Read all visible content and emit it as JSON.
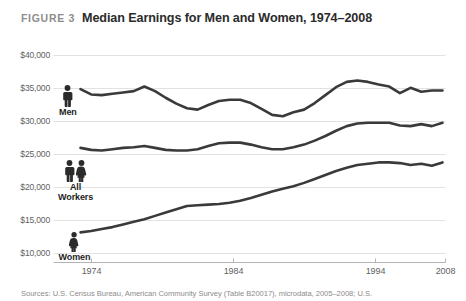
{
  "figure": {
    "label": "FIGURE 3",
    "title": "Median Earnings for Men and Women, 1974–2008",
    "source": "Sources: U.S. Census Bureau, American Community Survey (Table B20017), microdata, 2005–2008; U.S."
  },
  "colors": {
    "line": "#3a3a3a",
    "gridline": "#e2e2e2",
    "axis": "#b4b4b4",
    "label_text": "#5f5f5f",
    "title_text": "#2b2b2b",
    "figure_label_text": "#8d8d8d",
    "icon": "#2b2b2b",
    "background": "#ffffff"
  },
  "annotations": [
    {
      "name": "Men",
      "icon": "male-figure-icon",
      "icon_count": 1
    },
    {
      "name": "All\nWorkers",
      "icon": "male-female-figure-icon",
      "icon_count": 2
    },
    {
      "name": "Women",
      "icon": "female-figure-icon",
      "icon_count": 1
    }
  ],
  "chart_data": {
    "type": "line",
    "title": "Median Earnings for Men and Women, 1974–2008",
    "xlabel": "",
    "ylabel": "",
    "grid": true,
    "legend": "inline-labels",
    "xlim": [
      1974,
      2008
    ],
    "ylim": [
      10000,
      40000
    ],
    "ytick_labels": [
      "$40,000",
      "$35,000",
      "$30,000",
      "$25,000",
      "$20,000",
      "$15,000",
      "$10,000"
    ],
    "yticks": [
      40000,
      35000,
      30000,
      25000,
      20000,
      15000,
      10000
    ],
    "xtick_labels": [
      "1974",
      "1984",
      "1994",
      "2008"
    ],
    "xticks": [
      1974,
      1984,
      1994,
      2008
    ],
    "x": [
      1974,
      1975,
      1976,
      1977,
      1978,
      1979,
      1980,
      1981,
      1982,
      1983,
      1984,
      1985,
      1986,
      1987,
      1988,
      1989,
      1990,
      1991,
      1992,
      1993,
      1994,
      1995,
      1996,
      1997,
      1998,
      1999,
      2000,
      2001,
      2002,
      2003,
      2004,
      2005,
      2006,
      2007,
      2008
    ],
    "series": [
      {
        "name": "Men",
        "values": [
          34900,
          34100,
          34000,
          34200,
          34400,
          34600,
          35300,
          34600,
          33600,
          32700,
          32000,
          31800,
          32500,
          33100,
          33300,
          33300,
          32800,
          31900,
          31000,
          30800,
          31400,
          31800,
          32800,
          34000,
          35200,
          36000,
          36200,
          36000,
          35600,
          35300,
          34300,
          35100,
          34500,
          34700,
          34700
        ]
      },
      {
        "name": "All Workers",
        "values": [
          26000,
          25700,
          25600,
          25800,
          26000,
          26100,
          26300,
          26000,
          25700,
          25600,
          25600,
          25800,
          26300,
          26700,
          26800,
          26800,
          26500,
          26100,
          25800,
          25800,
          26100,
          26500,
          27100,
          27800,
          28600,
          29300,
          29700,
          29800,
          29800,
          29800,
          29400,
          29300,
          29600,
          29300,
          29800
        ]
      },
      {
        "name": "Women",
        "values": [
          13200,
          13400,
          13700,
          14000,
          14400,
          14800,
          15200,
          15700,
          16200,
          16700,
          17200,
          17300,
          17400,
          17500,
          17700,
          18000,
          18400,
          18900,
          19400,
          19800,
          20200,
          20700,
          21300,
          21900,
          22500,
          23000,
          23400,
          23600,
          23800,
          23800,
          23700,
          23400,
          23600,
          23300,
          23800
        ]
      }
    ]
  }
}
